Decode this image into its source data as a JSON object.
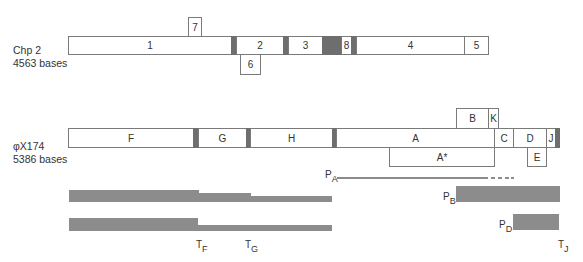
{
  "chp2": {
    "name": "Chp 2",
    "size": "4563 bases",
    "genes": {
      "g1": "1",
      "g2": "2",
      "g3": "3",
      "g4": "4",
      "g5": "5",
      "g6": "6",
      "g7": "7",
      "g8": "8"
    }
  },
  "phix174": {
    "name": "φX174",
    "size": "5386 bases",
    "genes": {
      "F": "F",
      "G": "G",
      "H": "H",
      "A": "A",
      "B": "B",
      "K": "K",
      "C": "C",
      "D": "D",
      "J": "J",
      "Astar": "A*",
      "E": "E"
    }
  },
  "promoters": {
    "PA": {
      "main": "P",
      "sub": "A"
    },
    "PB": {
      "main": "P",
      "sub": "B"
    },
    "PD": {
      "main": "P",
      "sub": "D"
    }
  },
  "terminators": {
    "TF": {
      "main": "T",
      "sub": "F"
    },
    "TG": {
      "main": "T",
      "sub": "G"
    },
    "TJ": {
      "main": "T",
      "sub": "J"
    }
  },
  "colors": {
    "intergenic_band": "#6e6e6e",
    "transcript": "#8c8c8c",
    "outline": "#7a7a7a"
  }
}
